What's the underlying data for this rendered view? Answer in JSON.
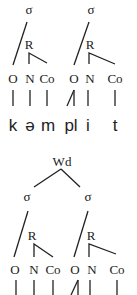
{
  "tree1": {
    "syllable_label": "σ",
    "rhyme_label": "R",
    "positions": [
      "O",
      "N",
      "Co",
      "O",
      "N",
      "Co"
    ],
    "segments": [
      "k",
      "ə",
      "m",
      "pl",
      "i",
      "t"
    ]
  },
  "tree2": {
    "word_label": "Wd",
    "syllable_label": "σ",
    "rhyme_label": "R",
    "positions": [
      "O",
      "N",
      "Co",
      "O",
      "N",
      "Co"
    ]
  }
}
